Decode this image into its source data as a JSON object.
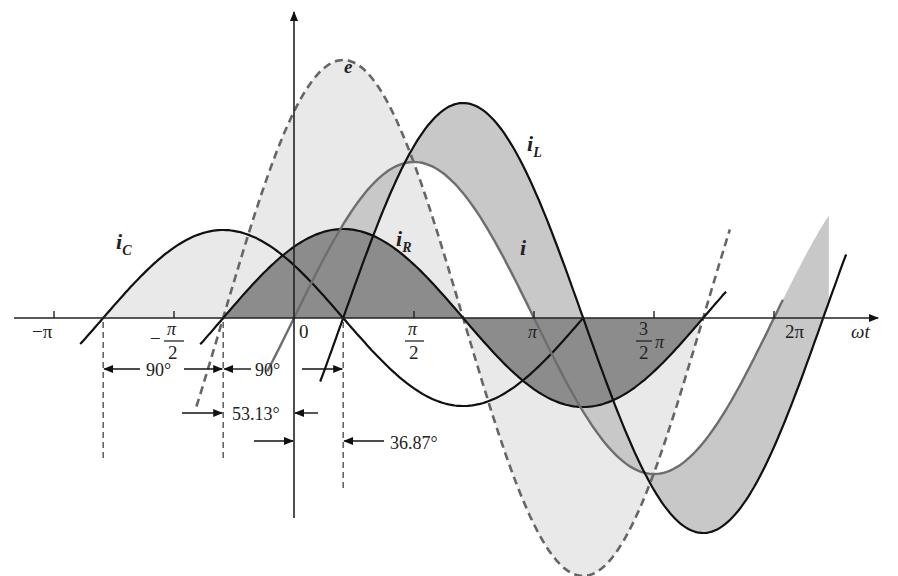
{
  "figure": {
    "x_axis_label": "ωt",
    "origin_label": "0",
    "ticks": [
      {
        "label": "−π",
        "rad": -3.14159
      },
      {
        "label_num": "π",
        "label_den": "2",
        "neg": true,
        "rad": -1.5708
      },
      {
        "label_num": "π",
        "label_den": "2",
        "neg": false,
        "rad": 1.5708
      },
      {
        "label": "π",
        "rad": 3.14159
      },
      {
        "label_num": "3",
        "label_den": "2",
        "suffix": "π",
        "rad": 4.71239
      },
      {
        "label": "2π",
        "rad": 6.28319
      }
    ],
    "curve_labels": {
      "e": "e",
      "iC": "i",
      "iC_sub": "C",
      "iR": "i",
      "iR_sub": "R",
      "iL": "i",
      "iL_sub": "L",
      "i": "i"
    },
    "annotations": {
      "a1": "90°",
      "a2": "90°",
      "a3": "53.13°",
      "a4": "36.87°"
    },
    "colors": {
      "axis": "#222222",
      "e_stroke": "#666666",
      "fill_light": "#e9e9e9",
      "fill_mid": "#c8c8c8",
      "fill_dark": "#8c8c8c",
      "i_stroke": "#6e6e6e",
      "black": "#111111"
    }
  },
  "chart_data": {
    "type": "line",
    "title": "",
    "xlabel": "ωt",
    "ylabel": "",
    "x_units": "rad",
    "x_range": [
      -3.8,
      7.2
    ],
    "series": [
      {
        "name": "e",
        "style": "dashed",
        "amplitude": 258,
        "phase_deg": 53.13
      },
      {
        "name": "i_R",
        "style": "solid",
        "amplitude": 89,
        "phase_deg": 53.13
      },
      {
        "name": "i_C",
        "style": "solid",
        "amplitude": 88,
        "phase_deg": 143.13
      },
      {
        "name": "i_L",
        "style": "solid",
        "amplitude": 215,
        "phase_deg": -36.87
      },
      {
        "name": "i",
        "style": "solid-gray",
        "amplitude": 156,
        "phase_deg": 0
      }
    ],
    "phase_annotations": [
      {
        "label": "90°",
        "between": [
          "i_C",
          "i_R"
        ]
      },
      {
        "label": "90°",
        "between": [
          "i_R",
          "i_L"
        ]
      },
      {
        "label": "53.13°",
        "between": [
          "e",
          "origin"
        ]
      },
      {
        "label": "36.87°",
        "between": [
          "origin",
          "i_L"
        ]
      }
    ],
    "x_ticks": [
      "−π",
      "−π/2",
      "0",
      "π/2",
      "π",
      "3/2 π",
      "2π"
    ]
  }
}
